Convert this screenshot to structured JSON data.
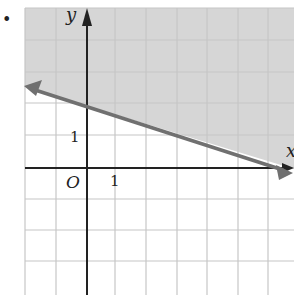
{
  "figure": {
    "bullet": "•",
    "y_axis_label": "y",
    "x_axis_label": "x",
    "origin_label": "O",
    "y_tick_label": "1",
    "x_tick_label": "1"
  },
  "graph": {
    "type": "linear-inequality",
    "boundary_line": {
      "through": [
        [
          0,
          2
        ],
        [
          6,
          0
        ]
      ],
      "slope": -0.3333,
      "y_intercept": 2,
      "style": "solid"
    },
    "shaded_region": "above line",
    "grid_unit": 1,
    "x_range": [
      -2,
      6.5
    ],
    "y_range": [
      -4,
      5
    ],
    "colors": {
      "shade": "#d4d4d4",
      "grid": "#c4c4c4",
      "axis": "#222222",
      "line": "#707070"
    }
  }
}
